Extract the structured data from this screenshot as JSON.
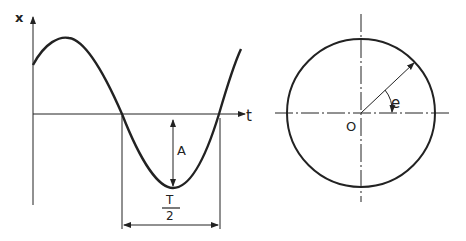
{
  "left_plot": {
    "y_axis_label": "x",
    "x_axis_label": "t",
    "amplitude_label": "A",
    "half_period_num": "T",
    "half_period_den": "2"
  },
  "right_plot": {
    "origin_label": "O",
    "angle_label": "e"
  },
  "colors": {
    "ink": "#222222",
    "background": "#ffffff"
  }
}
